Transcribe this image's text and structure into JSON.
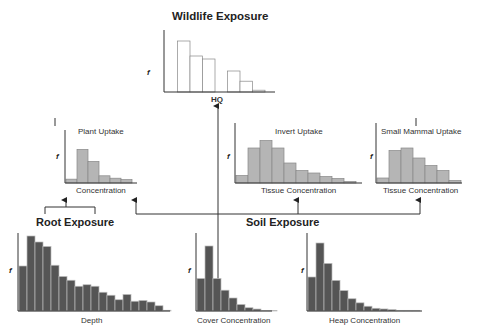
{
  "titles": {
    "wildlife": "Wildlife Exposure",
    "root": "Root Exposure",
    "soil": "Soil Exposure"
  },
  "panels": {
    "hq": {
      "xlabel": "HQ",
      "ylabel": "f"
    },
    "plant": {
      "title": "Plant Uptake",
      "xlabel": "Concentration",
      "ylabel": "f"
    },
    "invert": {
      "title": "Invert Uptake",
      "xlabel": "Tissue Concentration",
      "ylabel": "f"
    },
    "mammal": {
      "title": "Small Mammal Uptake",
      "xlabel": "Tissue Concentration",
      "ylabel": "f"
    },
    "depth": {
      "xlabel": "Depth",
      "ylabel": "f"
    },
    "cover": {
      "xlabel": "Cover Concentration",
      "ylabel": "f"
    },
    "heap": {
      "xlabel": "Heap Concentration",
      "ylabel": "f"
    }
  },
  "chart_data": [
    {
      "type": "bar",
      "title": "Wildlife Exposure",
      "xlabel": "HQ",
      "ylabel": "f",
      "values": [
        0,
        0.85,
        0.6,
        0.55,
        0,
        0.35,
        0.18,
        0.03
      ]
    },
    {
      "type": "bar",
      "title": "Plant Uptake",
      "xlabel": "Concentration",
      "ylabel": "f",
      "values": [
        0.08,
        0.7,
        0.45,
        0.15,
        0.1,
        0.07
      ]
    },
    {
      "type": "bar",
      "title": "Invert Uptake",
      "xlabel": "Tissue Concentration",
      "ylabel": "f",
      "values": [
        0.15,
        0.7,
        0.85,
        0.7,
        0.4,
        0.25,
        0.2,
        0.13,
        0.09,
        0.03
      ]
    },
    {
      "type": "bar",
      "title": "Small Mammal Uptake",
      "xlabel": "Tissue Concentration",
      "ylabel": "f",
      "values": [
        0.1,
        0.65,
        0.7,
        0.5,
        0.35,
        0.25,
        0.05
      ]
    },
    {
      "type": "bar",
      "title": "Root Exposure",
      "xlabel": "Depth",
      "ylabel": "f",
      "values": [
        0.6,
        1.0,
        0.92,
        0.86,
        0.61,
        0.46,
        0.41,
        0.33,
        0.35,
        0.33,
        0.25,
        0.21,
        0.15,
        0.22,
        0.13,
        0.14,
        0.12,
        0.07,
        0.01
      ]
    },
    {
      "type": "bar",
      "title": "Soil Exposure",
      "xlabel": "Cover Concentration",
      "ylabel": "f",
      "values": [
        0.5,
        1.0,
        0.5,
        0.32,
        0.2,
        0.1,
        0.05,
        0.03,
        0.01,
        0.01
      ]
    },
    {
      "type": "bar",
      "title": "Soil Exposure",
      "xlabel": "Heap Concentration",
      "ylabel": "f",
      "values": [
        0.5,
        1.0,
        0.7,
        0.45,
        0.3,
        0.18,
        0.12,
        0.07,
        0.04,
        0.03,
        0.02,
        0.01,
        0.01,
        0.01
      ]
    }
  ]
}
